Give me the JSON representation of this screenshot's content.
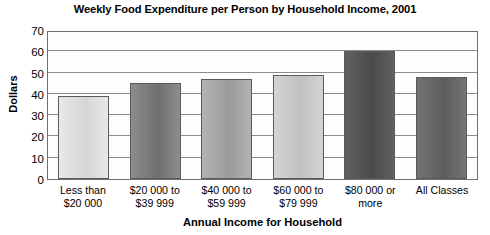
{
  "chart_data": {
    "type": "bar",
    "title": "Weekly Food Expenditure per Person by Household Income, 2001",
    "xlabel": "Annual Income for Household",
    "ylabel": "Dollars",
    "ylim": [
      0,
      70
    ],
    "ytick_step": 10,
    "yticks": [
      "70",
      "60",
      "50",
      "40",
      "30",
      "20",
      "10",
      "0"
    ],
    "grid": true,
    "legend": "none",
    "categories": [
      "Less than\n$20 000",
      "$20 000 to\n$39 999",
      "$40 000 to\n$59 999",
      "$60 000 to\n$79 999",
      "$80 000 or\nmore",
      "All Classes"
    ],
    "category_lines": [
      [
        "Less than",
        "$20 000"
      ],
      [
        "$20 000 to",
        "$39 999"
      ],
      [
        "$40 000 to",
        "$59 999"
      ],
      [
        "$60 000 to",
        "$79 999"
      ],
      [
        "$80 000 or",
        "more"
      ],
      [
        "All Classes",
        ""
      ]
    ],
    "values": [
      39,
      45,
      47,
      49,
      60,
      48
    ],
    "bar_colors": [
      "#d6d6d6",
      "#6f6f6f",
      "#9a9a9a",
      "#c0c0c0",
      "#4a4a4a",
      "#5c5c5c"
    ],
    "bar_colors_light": [
      "#e8e8e8",
      "#8d8d8d",
      "#b4b4b4",
      "#d4d4d4",
      "#616161",
      "#747474"
    ],
    "bar_border_color": "#5a5a5a",
    "plot_border_color": "#6f6f6f",
    "gridline_color": "#8c8c8c",
    "background_color": "#ffffff",
    "text_color": "#000000"
  }
}
